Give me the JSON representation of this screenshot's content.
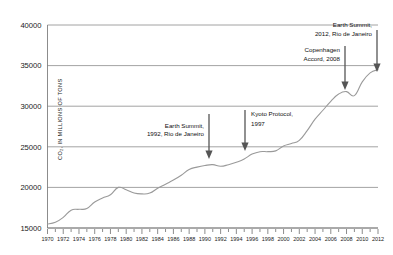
{
  "chart_data": {
    "type": "line",
    "title": "",
    "xlabel": "",
    "ylabel": "CO2, IN MILLIONS OF TONS",
    "ylabel_display": "CO₂, IN MILLIONS OF TONS",
    "xlim": [
      1970,
      2012
    ],
    "ylim": [
      15000,
      40000
    ],
    "grid": true,
    "legend": "none",
    "ytick_labels": [
      "40000",
      "35000",
      "30000",
      "25000",
      "20000",
      "15000"
    ],
    "ytick_values": [
      40000,
      35000,
      30000,
      25000,
      20000,
      15000
    ],
    "xtick_labels": [
      "1970",
      "1972",
      "1974",
      "1976",
      "1978",
      "1980",
      "1982",
      "1984",
      "1986",
      "1988",
      "1990",
      "1992",
      "1994",
      "1996",
      "1998",
      "2000",
      "2002",
      "2004",
      "2006",
      "2008",
      "2010",
      "2012"
    ],
    "xtick_values": [
      1970,
      1972,
      1974,
      1976,
      1978,
      1980,
      1982,
      1984,
      1986,
      1988,
      1990,
      1992,
      1994,
      1996,
      1998,
      2000,
      2002,
      2004,
      2006,
      2008,
      2010,
      2012
    ],
    "series_name": "Global CO2 emissions",
    "x": [
      1970,
      1971,
      1972,
      1973,
      1974,
      1975,
      1976,
      1977,
      1978,
      1979,
      1980,
      1981,
      1982,
      1983,
      1984,
      1985,
      1986,
      1987,
      1988,
      1989,
      1990,
      1991,
      1992,
      1993,
      1994,
      1995,
      1996,
      1997,
      1998,
      1999,
      2000,
      2001,
      2002,
      2003,
      2004,
      2005,
      2006,
      2007,
      2008,
      2009,
      2010,
      2011,
      2012
    ],
    "values": [
      15500,
      15700,
      16300,
      17200,
      17300,
      17400,
      18200,
      18700,
      19100,
      20000,
      19700,
      19300,
      19200,
      19300,
      19900,
      20400,
      20900,
      21500,
      22200,
      22500,
      22700,
      22800,
      22600,
      22800,
      23100,
      23500,
      24100,
      24400,
      24400,
      24500,
      25100,
      25400,
      25800,
      27000,
      28400,
      29500,
      30600,
      31500,
      31800,
      31300,
      33000,
      34100,
      34500
    ]
  },
  "annotations": [
    {
      "name": "earth-summit-1992",
      "lines": [
        "Earth Summit,",
        "1992, Rio de Janeiro"
      ],
      "align": "right"
    },
    {
      "name": "kyoto-protocol-1997",
      "lines": [
        "Kyoto Protocol,",
        "1997"
      ],
      "align": "left"
    },
    {
      "name": "copenhagen-accord-2008",
      "lines": [
        "Copenhagen",
        "Accord, 2008"
      ],
      "align": "right"
    },
    {
      "name": "earth-summit-2012",
      "lines": [
        "Earth Summit,",
        "2012, Rio de Janeiro"
      ],
      "align": "right"
    }
  ],
  "colors": {
    "background": "#ffffff",
    "line": "#9a9a9a",
    "grid": "#8c8c8c",
    "text": "#1a1a1a",
    "arrow": "#555555"
  }
}
